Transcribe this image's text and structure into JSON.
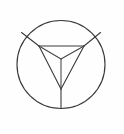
{
  "figure": {
    "kind": "geometric-line-drawing",
    "background_color": "#fefefe",
    "stroke_color": "#3a3a3a",
    "inner_stroke_color": "#454545",
    "canvas": {
      "width": 124,
      "height": 134
    },
    "circle": {
      "name": "outer-circle",
      "cx": 61,
      "cy": 64.5,
      "r": 44
    },
    "vertices": {
      "top_left": {
        "x": 39,
        "y": 46
      },
      "top_right": {
        "x": 84,
        "y": 46
      },
      "bottom_apex": {
        "x": 61,
        "y": 89
      },
      "center_node": {
        "x": 61,
        "y": 59
      }
    },
    "triangle_edges": [
      {
        "name": "edge-top",
        "x1": 39,
        "y1": 46,
        "x2": 84,
        "y2": 46
      },
      {
        "name": "edge-left",
        "x1": 39,
        "y1": 46,
        "x2": 61,
        "y2": 89
      },
      {
        "name": "edge-right",
        "x1": 84,
        "y1": 46,
        "x2": 61,
        "y2": 89
      }
    ],
    "inner_edges": [
      {
        "name": "inner-edge-to-top-left",
        "x1": 61,
        "y1": 59,
        "x2": 39,
        "y2": 46
      },
      {
        "name": "inner-edge-to-top-right",
        "x1": 61,
        "y1": 59,
        "x2": 84,
        "y2": 46
      },
      {
        "name": "inner-edge-to-bottom-apex",
        "x1": 61,
        "y1": 59,
        "x2": 61,
        "y2": 89
      }
    ],
    "radial_spokes": [
      {
        "name": "spoke-upper-left",
        "x1": 39,
        "y1": 46,
        "x2": 21.5,
        "y2": 32.5
      },
      {
        "name": "spoke-upper-right",
        "x1": 84,
        "y1": 46,
        "x2": 100.5,
        "y2": 32.5
      },
      {
        "name": "spoke-bottom",
        "x1": 61,
        "y1": 89,
        "x2": 61,
        "y2": 108.5
      }
    ]
  }
}
